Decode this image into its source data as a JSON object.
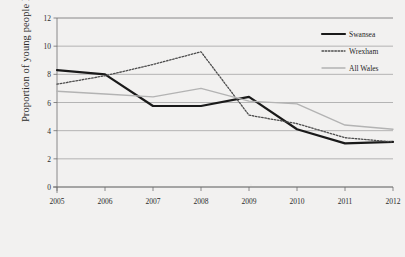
{
  "chart_data": {
    "type": "line",
    "title": "",
    "xlabel": "",
    "ylabel": "Proportion of young people NEET%",
    "categories": [
      "2005",
      "2006",
      "2007",
      "2008",
      "2009",
      "2010",
      "2011",
      "2012"
    ],
    "x": [
      2005,
      2006,
      2007,
      2008,
      2009,
      2010,
      2011,
      2012
    ],
    "ylim": [
      0,
      12
    ],
    "yticks": [
      0,
      2,
      4,
      6,
      8,
      10,
      12
    ],
    "ytick_labels": [
      "0",
      "2",
      "4",
      "6",
      "8",
      "10",
      "12"
    ],
    "grid": true,
    "grid_axis": "y",
    "legend_position": "top-right",
    "series": [
      {
        "name": "Swansea",
        "style": "solid",
        "color": "#1a1a1a",
        "width": 2.2,
        "values": [
          8.3,
          8.0,
          5.75,
          5.75,
          6.4,
          4.1,
          3.1,
          3.2
        ]
      },
      {
        "name": "Wrexham",
        "style": "dotted",
        "color": "#4d4d4d",
        "width": 1.3,
        "values": [
          7.3,
          7.9,
          8.7,
          9.6,
          5.1,
          4.5,
          3.5,
          3.2
        ]
      },
      {
        "name": "All Wales",
        "style": "solid",
        "color": "#b3b3b3",
        "width": 1.4,
        "values": [
          6.8,
          6.6,
          6.4,
          7.0,
          6.1,
          5.9,
          4.4,
          4.1
        ]
      }
    ]
  },
  "axes": {
    "y_axis_title": "Proportion of young people NEET%"
  },
  "legend": {
    "entries": [
      {
        "label": "Swansea"
      },
      {
        "label": "Wrexham"
      },
      {
        "label": "All Wales"
      }
    ]
  },
  "colors": {
    "background": "#f2f1f0",
    "grid": "#9a9a9a",
    "axis": "#6e6e6e",
    "text": "#2b2b2b",
    "swansea": "#1a1a1a",
    "wrexham": "#4d4d4d",
    "all_wales": "#b3b3b3"
  }
}
